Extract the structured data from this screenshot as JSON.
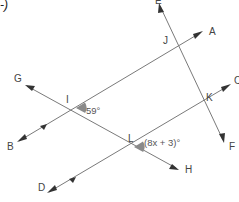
{
  "corner_mark": "-)",
  "points": {
    "A": "A",
    "B": "B",
    "C": "C",
    "D": "D",
    "E": "E",
    "F": "F",
    "G": "G",
    "H": "H",
    "I": "I",
    "J": "J",
    "K": "K",
    "L": "L"
  },
  "angles": {
    "at_I": "59°",
    "at_L": "(8x + 3)°"
  },
  "colors": {
    "line": "#7a7a7a",
    "arrow": "#333333",
    "angle_marker": "#8a8a8a",
    "label": "#444444"
  },
  "lines": [
    {
      "name": "line-BA",
      "from": "B",
      "to": "A",
      "parallel_mark": true
    },
    {
      "name": "line-DC",
      "from": "D",
      "to": "C",
      "parallel_mark": true
    },
    {
      "name": "transversal-GH",
      "from": "G",
      "to": "H"
    },
    {
      "name": "transversal-EF",
      "from": "E",
      "to": "F"
    }
  ]
}
